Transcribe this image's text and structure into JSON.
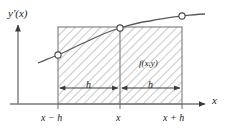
{
  "figure": {
    "axes": {
      "y_label": "y′(x)",
      "x_label": "x",
      "y_axis_x": 18,
      "x_axis_y": 104
    },
    "x_ticks": [
      {
        "label": "x − h",
        "x": 58
      },
      {
        "label": "x",
        "x": 120
      },
      {
        "label": "x + h",
        "x": 182
      }
    ],
    "dimensions": [
      {
        "label": "h",
        "from_x": 58,
        "to_x": 120,
        "y": 88
      },
      {
        "label": "h",
        "from_x": 120,
        "to_x": 182,
        "y": 88
      }
    ],
    "region": {
      "label": "f(x,y)",
      "left": 58,
      "right": 182,
      "top": 27,
      "bottom": 104,
      "fill": "#ffffff",
      "hatch_color": "#8c8c8c",
      "hatch_angle_deg": 45
    },
    "curve": {
      "name": "y′(x)",
      "color": "#5a5a5a",
      "points": [
        {
          "x": 38,
          "y": 63
        },
        {
          "x": 58,
          "y": 55
        },
        {
          "x": 88,
          "y": 41
        },
        {
          "x": 120,
          "y": 28
        },
        {
          "x": 150,
          "y": 21
        },
        {
          "x": 182,
          "y": 16
        },
        {
          "x": 205,
          "y": 14
        }
      ]
    },
    "markers": [
      {
        "name": "marker-left",
        "x": 58,
        "y": 55
      },
      {
        "name": "marker-mid",
        "x": 120,
        "y": 28
      },
      {
        "name": "marker-right",
        "x": 182,
        "y": 16
      }
    ],
    "colors": {
      "axis": "#7a7a7a",
      "rect_border": "#6e6e6e",
      "hatch": "#9a9a9a",
      "curve": "#5a5a5a",
      "marker_stroke": "#4a4a4a",
      "marker_fill": "#ffffff",
      "arrow": "#3c3c3c",
      "text": "#1a1a1a",
      "background": "#ffffff"
    }
  }
}
